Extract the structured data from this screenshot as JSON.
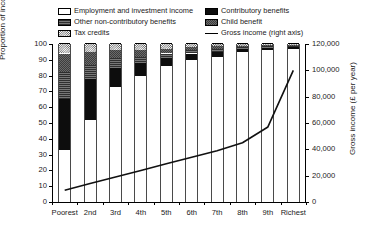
{
  "chart_data": {
    "type": "bar",
    "title": "",
    "xlabel": "",
    "ylabel": "Proportion of income (%)",
    "ylabel_right": "Gross income (£ per year)",
    "grid": false,
    "legend_position": "top",
    "categories": [
      "Poorest",
      "2nd",
      "3rd",
      "4th",
      "5th",
      "6th",
      "7th",
      "8th",
      "9th",
      "Richest"
    ],
    "ylim": [
      0,
      100
    ],
    "yticks": [
      0,
      10,
      20,
      30,
      40,
      50,
      60,
      70,
      80,
      90,
      100
    ],
    "ytick_labels": [
      "0",
      "10",
      "20",
      "30",
      "40",
      "50",
      "60",
      "70",
      "80",
      "90",
      "100"
    ],
    "ylim_right": [
      0,
      120000
    ],
    "yticks_right": [
      0,
      20000,
      40000,
      60000,
      80000,
      100000,
      120000
    ],
    "ytick_labels_right": [
      "0",
      "20,000",
      "40,000",
      "60,000",
      "80,000",
      "100,000",
      "120,000"
    ],
    "series": [
      {
        "name": "Employment and investment income",
        "fill": "f-white",
        "values": [
          33,
          52,
          73,
          80,
          86,
          90,
          92,
          95,
          96,
          97
        ]
      },
      {
        "name": "Contributory benefits",
        "fill": "f-black",
        "values": [
          32,
          26,
          12,
          8,
          5,
          4,
          3,
          2,
          1.5,
          1
        ]
      },
      {
        "name": "Other non-contributory benefits",
        "fill": "f-mid",
        "values": [
          17,
          9,
          6,
          4,
          3,
          2,
          2,
          1,
          1,
          1
        ]
      },
      {
        "name": "Child benefit",
        "fill": "f-darkgrey",
        "values": [
          12,
          8,
          5,
          4,
          3,
          2,
          2,
          1,
          1,
          0.6
        ]
      },
      {
        "name": "Tax credits",
        "fill": "f-checker",
        "values": [
          6,
          5,
          4,
          4,
          3,
          2,
          1,
          1,
          0.5,
          0.4
        ]
      }
    ],
    "line_series": {
      "name": "Gross income (right axis)",
      "axis": "right",
      "values": [
        9000,
        14000,
        19000,
        24000,
        29000,
        34000,
        39000,
        45000,
        57000,
        100000
      ]
    }
  },
  "legend": {
    "column_left": [
      {
        "label": "Employment and investment income",
        "swatch": "f-white"
      },
      {
        "label": "Other non-contributory benefits",
        "swatch": "f-mid"
      },
      {
        "label": "Tax credits",
        "swatch": "f-checker"
      }
    ],
    "column_right": [
      {
        "label": "Contributory benefits",
        "swatch": "f-black"
      },
      {
        "label": "Child benefit",
        "swatch": "f-darkgrey"
      },
      {
        "label": "Gross income (right axis)",
        "swatch": "line"
      }
    ]
  }
}
